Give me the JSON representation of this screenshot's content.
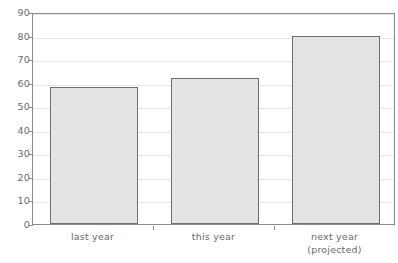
{
  "chart_data": {
    "type": "bar",
    "title": "",
    "subtitle": "",
    "xlabel": "",
    "ylabel": "",
    "categories": [
      "last year",
      "this year",
      "next year\n(projected)"
    ],
    "category_lines": [
      [
        "last year"
      ],
      [
        "this year"
      ],
      [
        "next year",
        "(projected)"
      ]
    ],
    "values": [
      58,
      62,
      80
    ],
    "ylim": [
      0,
      90
    ],
    "ytick_values": [
      0,
      10,
      20,
      30,
      40,
      50,
      60,
      70,
      80,
      90
    ],
    "ytick_labels": [
      "0",
      "10",
      "20",
      "30",
      "40",
      "50",
      "60",
      "70",
      "80",
      "90"
    ],
    "grid": true,
    "legend": false,
    "legend_position": "none",
    "colors": {
      "bar_fill": "#e4e4e4",
      "bar_border": "#6e6e6e",
      "gridline": "#e6e6e6",
      "axis": "#8a8a8a",
      "tick_text": "#6a6a6a",
      "background": "#ffffff"
    }
  }
}
